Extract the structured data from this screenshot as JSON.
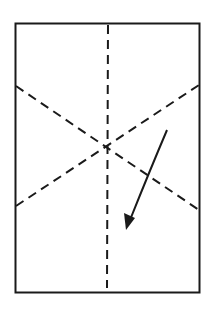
{
  "diagram": {
    "type": "folding-instruction",
    "colors": {
      "background": "#ffffff",
      "stroke": "#1a1a1a"
    },
    "sheet": {
      "x": 15,
      "y": 23,
      "width": 185,
      "height": 270
    },
    "fold_lines": [
      {
        "name": "vertical-center",
        "x1": 108,
        "y1": 25,
        "x2": 107,
        "y2": 288
      },
      {
        "name": "diagonal-down",
        "x1": 16,
        "y1": 86,
        "x2": 199,
        "y2": 210
      },
      {
        "name": "diagonal-up",
        "x1": 16,
        "y1": 206,
        "x2": 199,
        "y2": 85
      }
    ],
    "arrow": {
      "from": [
        167,
        130
      ],
      "to": [
        126,
        230
      ],
      "curved": true
    }
  }
}
